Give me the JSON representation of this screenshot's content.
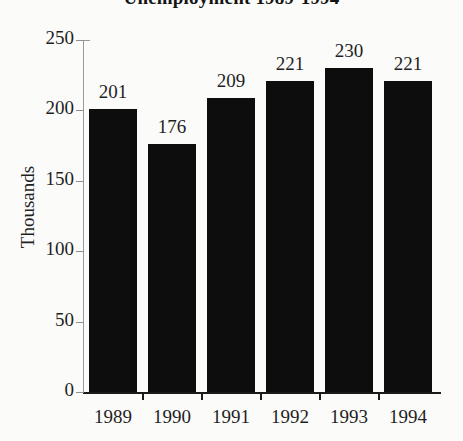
{
  "chart_data": {
    "type": "bar",
    "title": "Unemployment 1989-1994",
    "xlabel": "",
    "ylabel": "Thousands",
    "categories": [
      "1989",
      "1990",
      "1991",
      "1992",
      "1993",
      "1994"
    ],
    "values": [
      201,
      176,
      209,
      221,
      230,
      221
    ],
    "data_labels": [
      "201",
      "176",
      "209",
      "221",
      "230",
      "221"
    ],
    "ylim": [
      0,
      250
    ],
    "ytick_labels": [
      "0",
      "50",
      "100",
      "150",
      "200",
      "250"
    ],
    "ytick_values": [
      0,
      50,
      100,
      150,
      200,
      250
    ],
    "grid": false,
    "legend": null,
    "bar_color": "#0d0d0d",
    "background_color": "#fbfbfa",
    "axis_color": "#1a1a1a",
    "title_clipped_at_top": true
  }
}
